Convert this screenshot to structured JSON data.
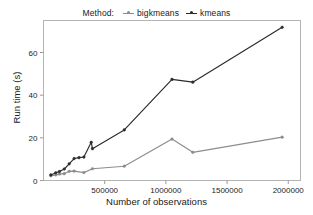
{
  "legend": {
    "title": "Method:",
    "entries": [
      {
        "label": "bigkmeans",
        "color": "#8c8c8c",
        "marker": "dot"
      },
      {
        "label": "kmeans",
        "color": "#2b2b2b",
        "marker": "dot"
      }
    ]
  },
  "axes": {
    "xlabel": "Number of observations",
    "ylabel": "Run time (s)",
    "xticks": [
      "500000",
      "1000000",
      "1500000",
      "2000000"
    ],
    "yticks": [
      "0",
      "20",
      "40",
      "60"
    ]
  },
  "chart_data": {
    "type": "line",
    "title": "",
    "subtitle": "",
    "xlabel": "Number of observations",
    "ylabel": "Run time (s)",
    "xlim": [
      0,
      2100000
    ],
    "ylim": [
      0,
      75
    ],
    "xticks": [
      500000,
      1000000,
      1500000,
      2000000
    ],
    "yticks": [
      0,
      20,
      40,
      60
    ],
    "grid": false,
    "legend_position": "top-center",
    "legend_title": "Method:",
    "series": [
      {
        "name": "bigkmeans",
        "color": "#8c8c8c",
        "points": [
          [
            60000,
            2.2
          ],
          [
            100000,
            2.6
          ],
          [
            130000,
            3.0
          ],
          [
            170000,
            3.2
          ],
          [
            210000,
            4.3
          ],
          [
            250000,
            4.4
          ],
          [
            330000,
            3.7
          ],
          [
            400000,
            5.5
          ],
          [
            660000,
            6.7
          ],
          [
            1050000,
            19.4
          ],
          [
            1220000,
            13.2
          ],
          [
            1950000,
            20.3
          ]
        ]
      },
      {
        "name": "kmeans",
        "color": "#2b2b2b",
        "points": [
          [
            60000,
            2.6
          ],
          [
            100000,
            3.6
          ],
          [
            130000,
            4.2
          ],
          [
            170000,
            5.4
          ],
          [
            210000,
            7.8
          ],
          [
            250000,
            10.3
          ],
          [
            290000,
            10.7
          ],
          [
            330000,
            11.0
          ],
          [
            390000,
            17.9
          ],
          [
            400000,
            14.9
          ],
          [
            660000,
            23.7
          ],
          [
            1050000,
            47.4
          ],
          [
            1220000,
            46.1
          ],
          [
            1950000,
            71.8
          ]
        ]
      }
    ]
  }
}
